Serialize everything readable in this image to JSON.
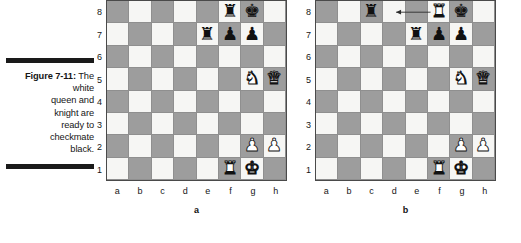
{
  "figure": {
    "label": "Figure 7-11:",
    "caption_lines": [
      "The white",
      "queen and",
      "knight are",
      "ready to",
      "checkmate",
      "black."
    ],
    "caption_full": "Figure 7-11: The white queen and knight are ready to checkmate black."
  },
  "colors": {
    "light_square": "#f6f6f4",
    "dark_square": "#9d9d9d",
    "board_border": "#4a4a4a",
    "grid_line": "#8f8f8f",
    "black_piece": "#111111",
    "white_piece": "#ffffff",
    "rule_bar": "#1a1a1a",
    "text": "#161616"
  },
  "axis": {
    "files": [
      "a",
      "b",
      "c",
      "d",
      "e",
      "f",
      "g",
      "h"
    ],
    "ranks": [
      "8",
      "7",
      "6",
      "5",
      "4",
      "3",
      "2",
      "1"
    ]
  },
  "boards": [
    {
      "id": "a",
      "label": "a",
      "pieces": [
        {
          "square": "f8",
          "glyph": "♜",
          "color": "black",
          "name": "black-rook"
        },
        {
          "square": "g8",
          "glyph": "♚",
          "color": "black",
          "name": "black-king"
        },
        {
          "square": "e7",
          "glyph": "♜",
          "color": "black",
          "name": "black-rook"
        },
        {
          "square": "f7",
          "glyph": "♟",
          "color": "black",
          "name": "black-pawn"
        },
        {
          "square": "g7",
          "glyph": "♟",
          "color": "black",
          "name": "black-pawn"
        },
        {
          "square": "g5",
          "glyph": "♞",
          "color": "white",
          "name": "white-knight"
        },
        {
          "square": "h5",
          "glyph": "♛",
          "color": "white",
          "name": "white-queen"
        },
        {
          "square": "g2",
          "glyph": "♟",
          "color": "white",
          "name": "white-pawn"
        },
        {
          "square": "h2",
          "glyph": "♟",
          "color": "white",
          "name": "white-pawn"
        },
        {
          "square": "f1",
          "glyph": "♜",
          "color": "white",
          "name": "white-rook"
        },
        {
          "square": "g1",
          "glyph": "♚",
          "color": "white",
          "name": "white-king"
        }
      ],
      "arrow": null
    },
    {
      "id": "b",
      "label": "b",
      "pieces": [
        {
          "square": "c8",
          "glyph": "♜",
          "color": "black",
          "name": "black-rook"
        },
        {
          "square": "f8",
          "glyph": "♜",
          "color": "white",
          "name": "white-rook"
        },
        {
          "square": "g8",
          "glyph": "♚",
          "color": "black",
          "name": "black-king"
        },
        {
          "square": "e7",
          "glyph": "♜",
          "color": "black",
          "name": "black-rook"
        },
        {
          "square": "f7",
          "glyph": "♟",
          "color": "black",
          "name": "black-pawn"
        },
        {
          "square": "g7",
          "glyph": "♟",
          "color": "black",
          "name": "black-pawn"
        },
        {
          "square": "g5",
          "glyph": "♞",
          "color": "white",
          "name": "white-knight"
        },
        {
          "square": "h5",
          "glyph": "♛",
          "color": "white",
          "name": "white-queen"
        },
        {
          "square": "g2",
          "glyph": "♟",
          "color": "white",
          "name": "white-pawn"
        },
        {
          "square": "h2",
          "glyph": "♟",
          "color": "white",
          "name": "white-pawn"
        },
        {
          "square": "f1",
          "glyph": "♜",
          "color": "white",
          "name": "white-rook"
        },
        {
          "square": "g1",
          "glyph": "♚",
          "color": "white",
          "name": "white-king"
        }
      ],
      "arrow": {
        "from": "f8",
        "to": "d8",
        "direction": "left",
        "color": "#2b2b2b"
      }
    }
  ]
}
